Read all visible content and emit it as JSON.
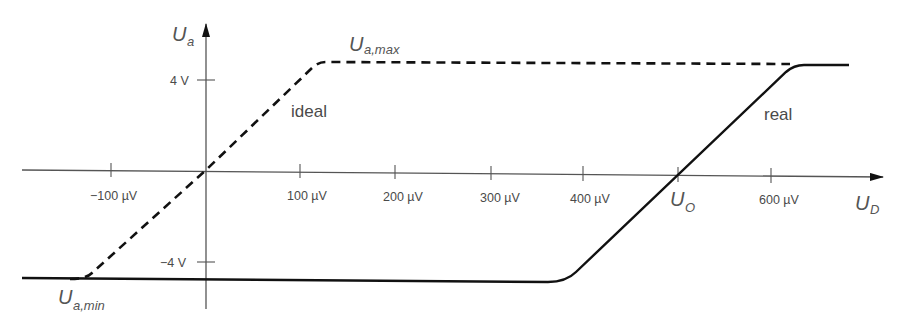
{
  "diagram": {
    "type": "transfer characteristic (op-amp)",
    "y_axis": {
      "label_main": "U",
      "label_sub": "a"
    },
    "x_axis": {
      "label_main": "U",
      "label_sub": "D"
    },
    "y_ticks": [
      {
        "label": "4 V"
      },
      {
        "label": "−4 V"
      }
    ],
    "x_ticks": [
      {
        "label": "−100 µV"
      },
      {
        "label": "100 µV"
      },
      {
        "label": "200 µV"
      },
      {
        "label": "300 µV"
      },
      {
        "label": "400 µV"
      },
      {
        "label_main": "U",
        "label_sub": "O"
      },
      {
        "label": "600 µV"
      }
    ],
    "annotations": {
      "ua_max_main": "U",
      "ua_max_sub": "a,max",
      "ua_min_main": "U",
      "ua_min_sub": "a,min",
      "ideal": "ideal",
      "real": "real"
    },
    "curves": [
      {
        "name": "ideal",
        "style": "dashed"
      },
      {
        "name": "real",
        "style": "solid"
      }
    ],
    "colors": {
      "axis": "#555555",
      "curve": "#111111",
      "text": "#4a4a4a"
    }
  }
}
